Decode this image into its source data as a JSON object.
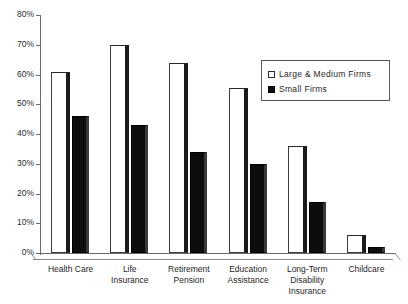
{
  "chart_data": {
    "type": "bar",
    "title": "",
    "subtitle": "",
    "xlabel": "",
    "ylabel": "",
    "ylim": [
      0,
      80
    ],
    "grid": false,
    "legend_position": "top-right",
    "categories": [
      "Health Care",
      "Life Insurance",
      "Retirement Pension",
      "Education Assistance",
      "Long-Term Disability Insurance",
      "Childcare"
    ],
    "category_label_lines": [
      [
        "Health Care"
      ],
      [
        "Life",
        "Insurance"
      ],
      [
        "Retirement",
        "Pension"
      ],
      [
        "Education",
        "Assistance"
      ],
      [
        "Long-Term",
        "Disability",
        "Insurance"
      ],
      [
        "Childcare"
      ]
    ],
    "ytick_labels": [
      "0%",
      "10%",
      "20%",
      "30%",
      "40%",
      "50%",
      "60%",
      "70%",
      "80%"
    ],
    "ytick_values": [
      0,
      10,
      20,
      30,
      40,
      50,
      60,
      70,
      80
    ],
    "series": [
      {
        "name": "Large & Medium Firms",
        "color": "#ffffff",
        "values": [
          61,
          70,
          64,
          55.5,
          36,
          6
        ]
      },
      {
        "name": "Small Firms",
        "color": "#0d0d0d",
        "values": [
          46,
          43,
          34,
          30,
          17,
          2
        ]
      }
    ]
  },
  "legend": {
    "items": [
      {
        "label": "Large & Medium Firms",
        "swatch": "open-square-icon"
      },
      {
        "label": "Small Firms",
        "swatch": "filled-square-icon"
      }
    ]
  }
}
